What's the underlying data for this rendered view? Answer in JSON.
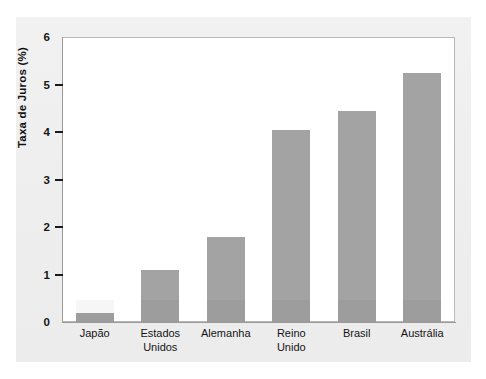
{
  "chart_data": {
    "type": "bar",
    "title": "",
    "xlabel": "",
    "ylabel": "Taxa de Juros (%)",
    "categories": [
      "Japão",
      "Estados Unidos",
      "Alemanha",
      "Reino Unido",
      "Brasil",
      "Austrália"
    ],
    "category_lines": [
      [
        "Japão"
      ],
      [
        "Estados",
        "Unidos"
      ],
      [
        "Alemanha"
      ],
      [
        "Reino",
        "Unido"
      ],
      [
        "Brasil"
      ],
      [
        "Austrália"
      ]
    ],
    "values": [
      0.2,
      1.1,
      1.8,
      4.05,
      4.45,
      5.25
    ],
    "ylim": [
      0,
      6
    ],
    "yticks": [
      0,
      1,
      2,
      3,
      4,
      5,
      6
    ],
    "ytick_labels": [
      "0",
      "1",
      "2",
      "3",
      "4",
      "5",
      "6"
    ],
    "grid": false,
    "legend": null,
    "bar_color": "#a3a3a3",
    "frame_color": "#b9b9b9",
    "background_color": "#ffffff",
    "page_color": "#efefef"
  }
}
